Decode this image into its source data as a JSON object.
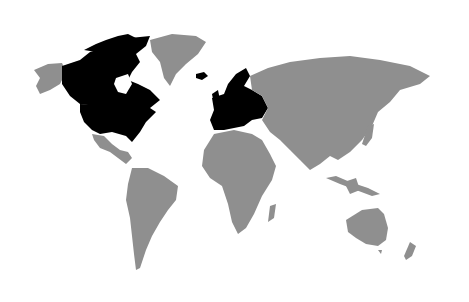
{
  "map": {
    "type": "world choropleth",
    "background_color": "#ffffff",
    "default_land_color": "#8f8f8f",
    "highlight_color": "#000000",
    "highlighted_regions": [
      "Canada",
      "United States",
      "Europe"
    ],
    "unhighlighted_regions": [
      "Alaska",
      "Greenland",
      "Mexico",
      "Central America",
      "South America",
      "Africa",
      "Russia",
      "Asia",
      "Middle East",
      "Australia",
      "New Zealand",
      "Iceland"
    ]
  }
}
